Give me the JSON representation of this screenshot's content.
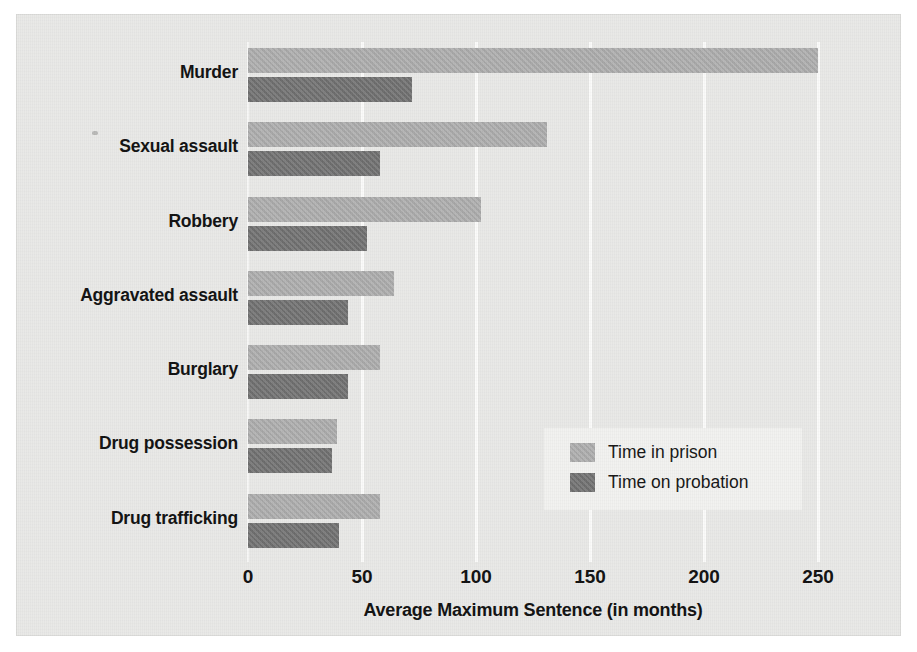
{
  "chart_data": {
    "type": "bar",
    "orientation": "horizontal",
    "title": "",
    "xlabel": "Average Maximum Sentence (in months)",
    "ylabel": "",
    "xlim": [
      0,
      260
    ],
    "xticks": [
      0,
      50,
      100,
      150,
      200,
      250
    ],
    "xtick_labels": [
      "0",
      "50",
      "100",
      "150",
      "200",
      "250"
    ],
    "grid": "vertical",
    "legend_position": "center-right",
    "categories": [
      "Murder",
      "Sexual assault",
      "Robbery",
      "Aggravated assault",
      "Burglary",
      "Drug possession",
      "Drug trafficking"
    ],
    "series": [
      {
        "name": "Time in prison",
        "color": "#aeaeae",
        "values": [
          250,
          131,
          102,
          64,
          58,
          39,
          58
        ]
      },
      {
        "name": "Time on probation",
        "color": "#727272",
        "values": [
          72,
          58,
          52,
          44,
          44,
          37,
          40
        ]
      }
    ]
  },
  "legend": {
    "items": [
      {
        "label": "Time in prison"
      },
      {
        "label": "Time on probation"
      }
    ]
  },
  "colors": {
    "prison": "#aeaeae",
    "probation": "#727272",
    "plate_background": "#e9e9e7",
    "gridline": "#fbfbfa",
    "text": "#111111"
  }
}
